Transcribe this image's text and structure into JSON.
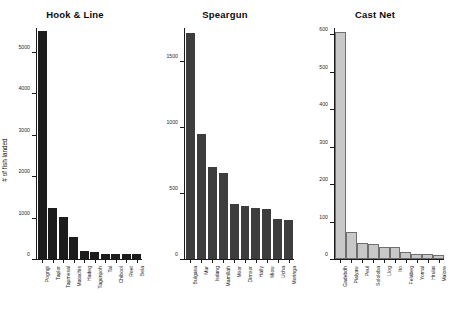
{
  "figure": {
    "background": "#ffffff",
    "shared_ylabel": "# of fish landed"
  },
  "chart_data": [
    {
      "type": "bar",
      "title": "Hook & Line",
      "xlabel": "",
      "ylabel": "# of fish landed",
      "ylim": [
        0,
        5600
      ],
      "yticks": [
        0,
        1000,
        2000,
        3000,
        4000,
        5000
      ],
      "ytick_labels": [
        "0",
        "1000",
        "2000",
        "3000",
        "4000",
        "5000"
      ],
      "grid": false,
      "legend": "none",
      "bar_color": "#1c1c1c",
      "categories": [
        "Pogngt",
        "Taplor",
        "Tapmesal",
        "Matachis",
        "Hadeg",
        "Tagunpoh",
        "Tal",
        "Chibool",
        "Reet",
        "Bela"
      ],
      "values": [
        5520,
        1230,
        1030,
        540,
        190,
        175,
        130,
        120,
        115,
        110
      ]
    },
    {
      "type": "bar",
      "title": "Speargun",
      "xlabel": "",
      "ylabel": "",
      "ylim": [
        0,
        1760
      ],
      "yticks": [
        0,
        500,
        1000,
        1500
      ],
      "ytick_labels": [
        "0",
        "500",
        "1000",
        "1500"
      ],
      "grid": false,
      "legend": "none",
      "bar_color": "#3d3d3d",
      "categories": [
        "Bulgasa",
        "Mur",
        "Isdang",
        "Mamillah",
        "Moor",
        "Dimoor",
        "Hally",
        "Miow",
        "Ucha",
        "Moringa"
      ],
      "values": [
        1720,
        955,
        700,
        655,
        420,
        405,
        385,
        380,
        305,
        295
      ]
    },
    {
      "type": "bar",
      "title": "Cast Net",
      "xlabel": "",
      "ylabel": "",
      "ylim": [
        0,
        620
      ],
      "yticks": [
        0,
        100,
        200,
        300,
        400,
        500,
        600
      ],
      "ytick_labels": [
        "0",
        "100",
        "200",
        "300",
        "400",
        "500",
        "600"
      ],
      "grid": false,
      "legend": "none",
      "bar_color": "#c8c8c8",
      "categories": [
        "Gadebdh",
        "Pialyaw",
        "Peul",
        "Sololoba",
        "Llog",
        "Ito",
        "Felabeg",
        "Yomal",
        "Hrulat",
        "Malore"
      ],
      "values": [
        605,
        68,
        38,
        35,
        27,
        26,
        14,
        9,
        7,
        6
      ]
    }
  ]
}
